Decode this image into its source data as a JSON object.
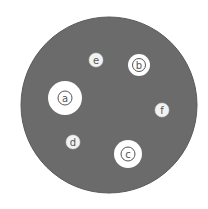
{
  "dish": {
    "cx": 109,
    "cy": 105,
    "r": 88,
    "color": "#6b6b6b",
    "border": "#5a5a5a"
  },
  "disks": [
    {
      "label": "a",
      "cx": 65,
      "cy": 98,
      "halo": 17,
      "ring": 7
    },
    {
      "label": "b",
      "cx": 139,
      "cy": 65,
      "halo": 11,
      "ring": 6.5
    },
    {
      "label": "c",
      "cx": 128,
      "cy": 154,
      "halo": 14,
      "ring": 7
    },
    {
      "label": "d",
      "cx": 73,
      "cy": 142,
      "halo": 0,
      "ring": 7
    },
    {
      "label": "e",
      "cx": 96,
      "cy": 60,
      "halo": 0,
      "ring": 7
    },
    {
      "label": "f",
      "cx": 162,
      "cy": 110,
      "halo": 0,
      "ring": 7
    }
  ],
  "colors": {
    "halo": "#ffffff",
    "disk": "#f2f2f2",
    "ring": "#555555",
    "text": "#555555"
  }
}
